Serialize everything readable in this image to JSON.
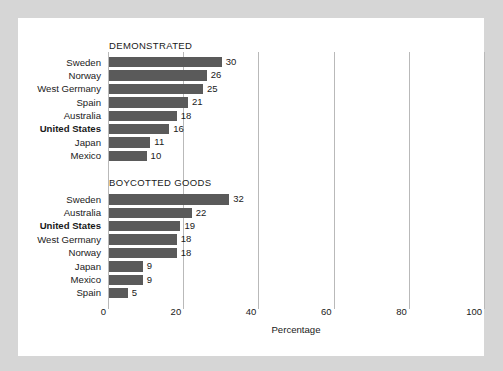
{
  "chart_data": {
    "type": "bar",
    "title": "",
    "xlabel": "Percentage",
    "ylabel": "",
    "orientation": "horizontal",
    "xlim": [
      0,
      100
    ],
    "xticks": [
      0,
      20,
      40,
      60,
      80,
      100
    ],
    "xtick_labels": [
      "0",
      "20",
      "40",
      "60",
      "80",
      "100"
    ],
    "grid": true,
    "legend": "none",
    "bar_color": "#5a5a5a",
    "gridline_color": "#b9b9b9",
    "panel_color": "#ffffff",
    "background_color": "#d6d6d6",
    "groups": [
      {
        "title": "DEMONSTRATED",
        "categories": [
          "Sweden",
          "Norway",
          "West Germany",
          "Spain",
          "Australia",
          "United States",
          "Japan",
          "Mexico"
        ],
        "values": [
          30,
          26,
          25,
          21,
          18,
          16,
          11,
          10
        ],
        "highlight": "United States"
      },
      {
        "title": "BOYCOTTED GOODS",
        "categories": [
          "Sweden",
          "Australia",
          "United States",
          "West Germany",
          "Norway",
          "Japan",
          "Mexico",
          "Spain"
        ],
        "values": [
          32,
          22,
          19,
          18,
          18,
          9,
          9,
          5
        ],
        "highlight": "United States"
      }
    ]
  }
}
